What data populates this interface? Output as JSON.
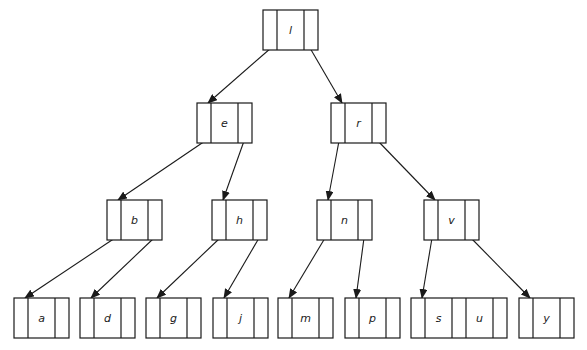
{
  "colors": {
    "stroke": "#1a1a1a",
    "background": "#ffffff"
  },
  "nodes": [
    {
      "id": "l",
      "keys": [
        "l"
      ],
      "x": 263,
      "y": 10,
      "level": 0
    },
    {
      "id": "e",
      "keys": [
        "e"
      ],
      "x": 197,
      "y": 103,
      "level": 1
    },
    {
      "id": "r",
      "keys": [
        "r"
      ],
      "x": 331,
      "y": 103,
      "level": 1
    },
    {
      "id": "b",
      "keys": [
        "b"
      ],
      "x": 107,
      "y": 200,
      "level": 2
    },
    {
      "id": "h",
      "keys": [
        "h"
      ],
      "x": 212,
      "y": 200,
      "level": 2
    },
    {
      "id": "n",
      "keys": [
        "n"
      ],
      "x": 317,
      "y": 200,
      "level": 2
    },
    {
      "id": "v",
      "keys": [
        "v"
      ],
      "x": 424,
      "y": 200,
      "level": 2
    },
    {
      "id": "a",
      "keys": [
        "a"
      ],
      "x": 14,
      "y": 298,
      "level": 3
    },
    {
      "id": "d",
      "keys": [
        "d"
      ],
      "x": 80,
      "y": 298,
      "level": 3
    },
    {
      "id": "g",
      "keys": [
        "g"
      ],
      "x": 146,
      "y": 298,
      "level": 3
    },
    {
      "id": "j",
      "keys": [
        "j"
      ],
      "x": 213,
      "y": 298,
      "level": 3
    },
    {
      "id": "m",
      "keys": [
        "m"
      ],
      "x": 278,
      "y": 298,
      "level": 3
    },
    {
      "id": "p",
      "keys": [
        "p"
      ],
      "x": 345,
      "y": 298,
      "level": 3
    },
    {
      "id": "su",
      "keys": [
        "s",
        "u"
      ],
      "x": 411,
      "y": 298,
      "level": 3
    },
    {
      "id": "y",
      "keys": [
        "y"
      ],
      "x": 519,
      "y": 298,
      "level": 3
    }
  ],
  "edges": [
    {
      "from": "l",
      "to": "e"
    },
    {
      "from": "l",
      "to": "r"
    },
    {
      "from": "e",
      "to": "b"
    },
    {
      "from": "e",
      "to": "h"
    },
    {
      "from": "r",
      "to": "n"
    },
    {
      "from": "r",
      "to": "v"
    },
    {
      "from": "b",
      "to": "a"
    },
    {
      "from": "b",
      "to": "d"
    },
    {
      "from": "h",
      "to": "g"
    },
    {
      "from": "h",
      "to": "j"
    },
    {
      "from": "n",
      "to": "m"
    },
    {
      "from": "n",
      "to": "p"
    },
    {
      "from": "v",
      "to": "su"
    },
    {
      "from": "v",
      "to": "y"
    }
  ]
}
